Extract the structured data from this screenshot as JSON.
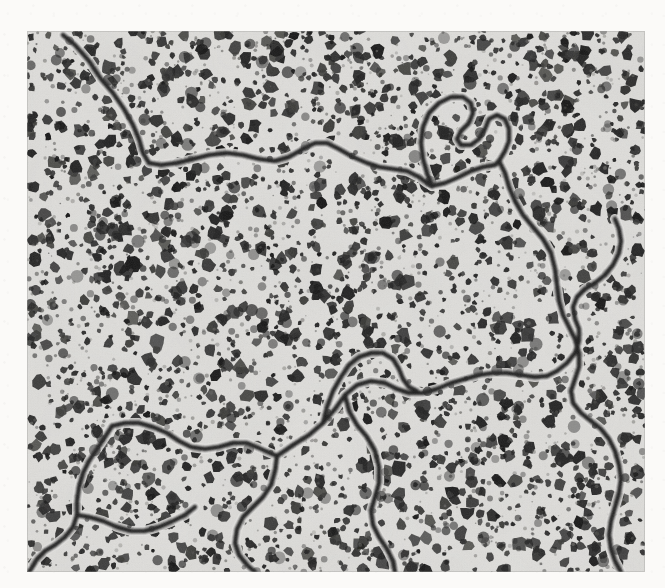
{
  "figure": {
    "kind": "micrograph"
  },
  "canvas": {
    "width": 665,
    "height": 588,
    "margin_color": "#fbfaf8"
  },
  "image_frame": {
    "x": 27,
    "y": 31,
    "width": 618,
    "height": 541
  },
  "palette": {
    "paper": "#fbfaf8",
    "matrix_light": "#e3e2df",
    "matrix_mid": "#cfcecb",
    "matrix_shadow": "#b6b5b2",
    "particle_dark": "#232323",
    "particle_core": "#141414",
    "boundary_line": "#1b1b1b",
    "halo": "#ededea"
  },
  "texture": {
    "particle_count": 2300,
    "particle_min_radius_px": 2.2,
    "particle_max_radius_px": 7.4,
    "halftone_pitch_px": 2.6,
    "halftone_opacity": 0.22,
    "grain_opacity": 0.3,
    "blur_px": 0.55
  },
  "boundary_network": {
    "stroke_width_px": 4.6,
    "stroke_color": "#1b1b1b",
    "halo_width_px": 10,
    "halo_color": "#e9e8e5",
    "junctions": [
      {
        "id": "J1",
        "x": 405,
        "y": 155
      },
      {
        "id": "J2",
        "x": 85,
        "y": 395
      },
      {
        "id": "J3",
        "x": 250,
        "y": 425
      },
      {
        "id": "J4",
        "x": 520,
        "y": 345
      }
    ],
    "paths": [
      {
        "id": "upper-ridge",
        "label": "upper boundary running from top-left edge to the central junction",
        "d": "M 36 4 L 48 14 L 62 30 L 74 48 L 86 62 L 97 78 L 106 94 L 112 108 L 116 122 L 122 132 L 134 134 L 150 132 L 166 128 L 182 124 L 200 122 L 216 124 L 232 128 L 248 130 L 262 126 L 276 118 L 288 112 L 300 112 L 312 118 L 326 126 L 340 132 L 352 136 L 366 138 L 380 140 L 392 146 L 400 152 L 405 155"
      },
      {
        "id": "loop-spur",
        "label": "looping spur rising above the central junction",
        "d": "M 405 155 L 400 142 L 396 128 L 394 112 L 396 96 L 402 82 L 412 72 L 424 66 L 436 66 L 444 72 L 446 82 L 442 92 L 434 100 L 430 108 L 434 114 L 444 114 L 452 108 L 458 98 L 462 88 L 470 84 L 478 88 L 482 98 L 482 110 L 478 120 L 472 130"
      },
      {
        "id": "junction-branch-east",
        "label": "short branch leaving the junction toward the east",
        "d": "M 405 155 L 418 152 L 432 146 L 444 140 L 456 136 L 468 134 L 472 130"
      },
      {
        "id": "right-descender",
        "label": "main boundary descending along the right half of the field",
        "d": "M 472 130 L 478 142 L 482 156 L 488 170 L 496 184 L 506 196 L 516 208 L 524 222 L 528 238 L 530 254 L 532 270 L 536 284 L 542 296 L 548 308 L 552 322 L 552 336 L 548 348 L 544 360 L 546 372 L 554 382 L 564 390 L 574 398 L 582 408 L 588 420 L 592 434 L 594 448 L 592 462 L 588 476 L 584 490 L 582 504 L 584 518 L 588 530 L 594 541"
      },
      {
        "id": "mid-transverse",
        "label": "transverse boundary crossing the lower middle of the field",
        "d": "M 250 425 L 266 414 L 282 404 L 296 392 L 308 378 L 318 364 L 330 354 L 344 350 L 358 352 L 370 358 L 382 362 L 396 362 L 410 358 L 424 352 L 438 348 L 452 344 L 466 342 L 480 342 L 494 344 L 508 346 L 520 345"
      },
      {
        "id": "zigzag-crest",
        "label": "jagged crest above the transverse boundary",
        "d": "M 296 392 L 300 376 L 306 360 L 314 346 L 322 334 L 332 326 L 344 322 L 356 322 L 366 328 L 372 338 L 376 348 L 382 356 L 390 360"
      },
      {
        "id": "east-hook",
        "label": "hooked segment linking transverse boundary to the right descender",
        "d": "M 520 345 L 530 340 L 540 332 L 548 322 L 552 310 L 552 298 L 548 288 L 546 276 L 550 266 L 558 258 L 568 252 L 578 244 L 586 234 L 592 222 L 594 210 L 592 198 L 588 188"
      },
      {
        "id": "lower-left-fan",
        "label": "branching boundary fanning across the lower-left region",
        "d": "M 85 395 L 98 392 L 112 392 L 126 396 L 140 402 L 152 410 L 164 416 L 178 418 L 192 416 L 206 412 L 220 412 L 234 418 L 250 425"
      },
      {
        "id": "lower-left-descender",
        "label": "boundary descending to the lower-left corner",
        "d": "M 85 395 L 78 406 L 70 418 L 62 430 L 56 442 L 52 456 L 50 470 L 50 484 L 46 496 L 38 506 L 28 514 L 18 520 L 10 528 L 4 538 L 2 541"
      },
      {
        "id": "lower-left-hook",
        "label": "small hook off the lower-left descender",
        "d": "M 50 484 L 62 486 L 76 490 L 90 496 L 104 500 L 118 500 L 132 496 L 146 490 L 158 484 L 168 476"
      },
      {
        "id": "lower-mid-descender",
        "label": "boundary curving down through the lower middle toward the bottom edge",
        "d": "M 250 425 L 248 440 L 244 454 L 236 466 L 226 476 L 216 486 L 210 498 L 208 512 L 212 524 L 220 534 L 228 541"
      },
      {
        "id": "bottom-spur",
        "label": "short spur reaching the bottom edge near the middle",
        "d": "M 318 364 L 322 380 L 330 394 L 340 406 L 348 420 L 352 436 L 352 452 L 348 466 L 344 480 L 346 494 L 352 506 L 360 518 L 366 530 L 368 541"
      }
    ]
  },
  "scale_bar": {
    "present": false
  },
  "labels": {
    "present": false
  }
}
